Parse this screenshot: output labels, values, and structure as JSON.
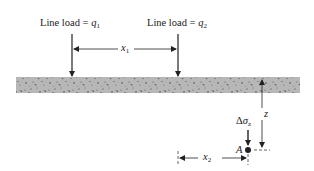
{
  "figure": {
    "load1": {
      "prefix": "Line load = ",
      "symbol": "q",
      "subscript": "1"
    },
    "load2": {
      "prefix": "Line load = ",
      "symbol": "q",
      "subscript": "2"
    },
    "dim_x1": {
      "symbol": "x",
      "subscript": "1"
    },
    "dim_x2": {
      "symbol": "x",
      "subscript": "2"
    },
    "dim_z": {
      "symbol": "z"
    },
    "stress": {
      "delta": "Δ",
      "symbol": "σ",
      "subscript": "z"
    },
    "point": {
      "label": "A"
    }
  },
  "colors": {
    "ink": "#222222",
    "soil": "#b4b4b4",
    "soil_speckle": "#3a3a3a"
  }
}
